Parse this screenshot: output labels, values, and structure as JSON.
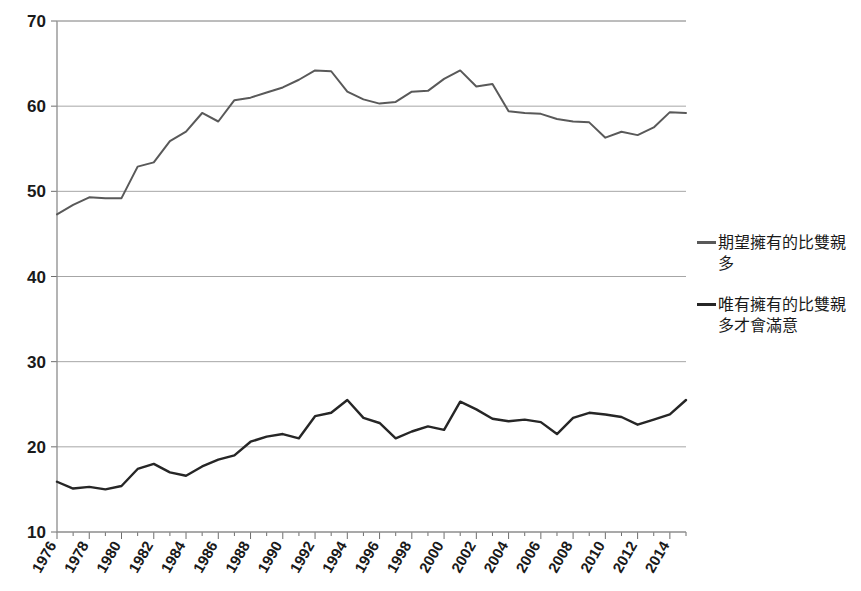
{
  "chart_data": {
    "type": "line",
    "title": "",
    "xlabel": "",
    "ylabel": "",
    "ylim": [
      10,
      70
    ],
    "ytick_values": [
      10,
      20,
      30,
      40,
      50,
      60,
      70
    ],
    "ytick_labels": [
      "10",
      "20",
      "30",
      "40",
      "50",
      "60",
      "70"
    ],
    "grid": true,
    "legend_position": "right",
    "x": [
      1976,
      1977,
      1978,
      1979,
      1980,
      1981,
      1982,
      1983,
      1984,
      1985,
      1986,
      1987,
      1988,
      1989,
      1990,
      1991,
      1992,
      1993,
      1994,
      1995,
      1996,
      1997,
      1998,
      1999,
      2000,
      2001,
      2002,
      2003,
      2004,
      2005,
      2006,
      2007,
      2008,
      2009,
      2010,
      2011,
      2012,
      2013,
      2014,
      2015
    ],
    "xtick_labels": [
      "1976",
      "1978",
      "1980",
      "1982",
      "1984",
      "1986",
      "1988",
      "1990",
      "1992",
      "1994",
      "1996",
      "1998",
      "2000",
      "2002",
      "2004",
      "2006",
      "2008",
      "2010",
      "2012",
      "2014"
    ],
    "xtick_values": [
      1976,
      1978,
      1980,
      1982,
      1984,
      1986,
      1988,
      1990,
      1992,
      1994,
      1996,
      1998,
      2000,
      2002,
      2004,
      2006,
      2008,
      2010,
      2012,
      2014
    ],
    "series": [
      {
        "name": "期望擁有的比雙親多",
        "color": "#595959",
        "width": 2.0,
        "values": [
          47.3,
          48.4,
          49.3,
          49.2,
          49.2,
          52.9,
          53.4,
          55.9,
          57.0,
          59.2,
          58.2,
          60.7,
          61.0,
          61.6,
          62.2,
          63.1,
          64.2,
          64.1,
          61.7,
          60.8,
          60.3,
          60.5,
          61.7,
          61.8,
          63.2,
          64.2,
          62.3,
          62.6,
          59.4,
          59.2,
          59.1,
          58.5,
          58.2,
          58.1,
          56.3,
          57.0,
          56.6,
          57.5,
          59.3,
          59.2
        ]
      },
      {
        "name": "唯有擁有的比雙親多才會滿意",
        "color": "#262626",
        "width": 2.4,
        "values": [
          15.9,
          15.1,
          15.3,
          15.0,
          15.4,
          17.4,
          18.0,
          17.0,
          16.6,
          17.7,
          18.5,
          19.0,
          20.6,
          21.2,
          21.5,
          21.0,
          23.6,
          24.0,
          25.5,
          23.4,
          22.8,
          21.0,
          21.8,
          22.4,
          22.0,
          25.3,
          24.4,
          23.3,
          23.0,
          23.2,
          22.9,
          21.5,
          23.4,
          24.0,
          23.8,
          23.5,
          22.6,
          23.2,
          23.8,
          25.5
        ]
      }
    ]
  },
  "legend": {
    "entries": [
      {
        "label": "期望擁有的比雙親多",
        "color": "#595959"
      },
      {
        "label": "唯有擁有的比雙親多才會滿意",
        "color": "#262626"
      }
    ]
  }
}
